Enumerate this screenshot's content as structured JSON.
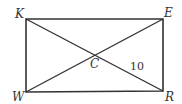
{
  "diagram": {
    "type": "rectangle-with-diagonals",
    "stroke_color": "#333333",
    "vertices": [
      {
        "name": "K",
        "x": 26,
        "y": 19,
        "label_x": 15,
        "label_y": 18
      },
      {
        "name": "E",
        "x": 163,
        "y": 19,
        "label_x": 164,
        "label_y": 17
      },
      {
        "name": "R",
        "x": 163,
        "y": 91,
        "label_x": 165,
        "label_y": 101
      },
      {
        "name": "W",
        "x": 26,
        "y": 92,
        "label_x": 12,
        "label_y": 101
      }
    ],
    "center": {
      "name": "C",
      "x": 95,
      "y": 55,
      "label": "C",
      "label_x": 90,
      "label_y": 68
    },
    "segment_label": {
      "text": "10",
      "segment": "CR",
      "x": 130,
      "y": 70
    }
  }
}
